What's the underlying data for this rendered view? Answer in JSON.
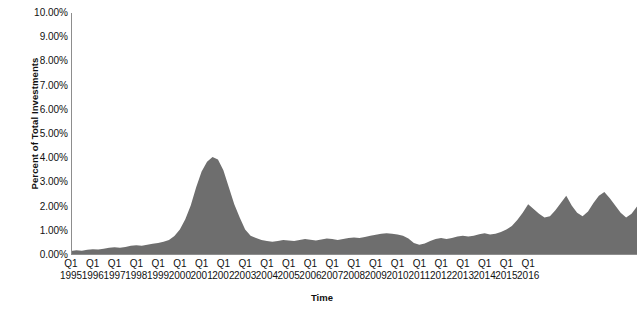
{
  "chart_data": {
    "type": "area",
    "title": "",
    "xlabel": "Time",
    "ylabel": "Percent of Total Investments",
    "ylim": [
      0,
      10
    ],
    "ytick_labels": [
      "10.00%",
      "9.00%",
      "8.00%",
      "7.00%",
      "6.00%",
      "5.00%",
      "4.00%",
      "3.00%",
      "2.00%",
      "1.00%",
      "0.00%"
    ],
    "ytick_values": [
      10,
      9,
      8,
      7,
      6,
      5,
      4,
      3,
      2,
      1,
      0
    ],
    "grid": false,
    "legend": "none",
    "series_color": "#6e6e6e",
    "axis_color": "#8d8d8d",
    "x_tick_quarter_label": "Q1",
    "x_tick_years": [
      1995,
      1996,
      1997,
      1998,
      1999,
      2000,
      2001,
      2002,
      2003,
      2004,
      2005,
      2006,
      2007,
      2008,
      2009,
      2010,
      2011,
      2012,
      2013,
      2014,
      2015,
      2016
    ],
    "x_start": "1995 Q1",
    "x_end": "2016 Q1",
    "x_quarter_labels": [
      "1995 Q1",
      "1995 Q2",
      "1995 Q3",
      "1995 Q4",
      "1996 Q1",
      "1996 Q2",
      "1996 Q3",
      "1996 Q4",
      "1997 Q1",
      "1997 Q2",
      "1997 Q3",
      "1997 Q4",
      "1998 Q1",
      "1998 Q2",
      "1998 Q3",
      "1998 Q4",
      "1999 Q1",
      "1999 Q2",
      "1999 Q3",
      "1999 Q4",
      "2000 Q1",
      "2000 Q2",
      "2000 Q3",
      "2000 Q4",
      "2001 Q1",
      "2001 Q2",
      "2001 Q3",
      "2001 Q4",
      "2002 Q1",
      "2002 Q2",
      "2002 Q3",
      "2002 Q4",
      "2003 Q1",
      "2003 Q2",
      "2003 Q3",
      "2003 Q4",
      "2004 Q1",
      "2004 Q2",
      "2004 Q3",
      "2004 Q4",
      "2005 Q1",
      "2005 Q2",
      "2005 Q3",
      "2005 Q4",
      "2006 Q1",
      "2006 Q2",
      "2006 Q3",
      "2006 Q4",
      "2007 Q1",
      "2007 Q2",
      "2007 Q3",
      "2007 Q4",
      "2008 Q1",
      "2008 Q2",
      "2008 Q3",
      "2008 Q4",
      "2009 Q1",
      "2009 Q2",
      "2009 Q3",
      "2009 Q4",
      "2010 Q1",
      "2010 Q2",
      "2010 Q3",
      "2010 Q4",
      "2011 Q1",
      "2011 Q2",
      "2011 Q3",
      "2011 Q4",
      "2012 Q1",
      "2012 Q2",
      "2012 Q3",
      "2012 Q4",
      "2013 Q1",
      "2013 Q2",
      "2013 Q3",
      "2013 Q4",
      "2014 Q1",
      "2014 Q2",
      "2014 Q3",
      "2014 Q4",
      "2015 Q1",
      "2015 Q2",
      "2015 Q3",
      "2015 Q4",
      "2016 Q1"
    ],
    "values": [
      0.17,
      0.2,
      0.18,
      0.22,
      0.24,
      0.23,
      0.26,
      0.3,
      0.32,
      0.3,
      0.33,
      0.38,
      0.4,
      0.38,
      0.42,
      0.46,
      0.5,
      0.55,
      0.62,
      0.78,
      1.05,
      1.48,
      2.05,
      2.8,
      3.45,
      3.85,
      4.05,
      3.95,
      3.5,
      2.8,
      2.1,
      1.55,
      1.05,
      0.8,
      0.7,
      0.62,
      0.58,
      0.55,
      0.58,
      0.62,
      0.6,
      0.58,
      0.62,
      0.66,
      0.63,
      0.6,
      0.64,
      0.68,
      0.66,
      0.62,
      0.66,
      0.7,
      0.72,
      0.7,
      0.74,
      0.8,
      0.84,
      0.88,
      0.9,
      0.88,
      0.85,
      0.8,
      0.68,
      0.5,
      0.42,
      0.48,
      0.58,
      0.66,
      0.7,
      0.66,
      0.7,
      0.76,
      0.8,
      0.76,
      0.8,
      0.86,
      0.9,
      0.85,
      0.88,
      0.95,
      1.05,
      1.2,
      1.45,
      1.75,
      2.1,
      1.9,
      1.7,
      1.55,
      1.6,
      1.85,
      2.15,
      2.45,
      2.05,
      1.75,
      1.6,
      1.8,
      2.15,
      2.45,
      2.6,
      2.35,
      2.05,
      1.75,
      1.55,
      1.7,
      2.0
    ]
  }
}
